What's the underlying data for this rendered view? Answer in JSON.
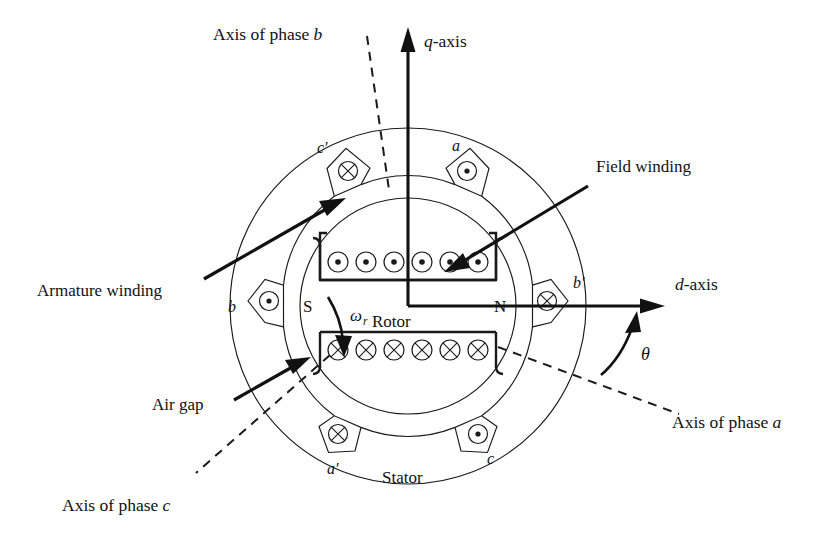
{
  "figure": {
    "background_color": "#ffffff",
    "line_color": "#1a1a1a"
  },
  "axes": [
    {
      "id": "q-axis",
      "name_plain": "q",
      "suffix": "-axis",
      "style": "solid-arrow",
      "label": "q-axis"
    },
    {
      "id": "d-axis",
      "name_plain": "d",
      "suffix": "-axis",
      "style": "solid-arrow",
      "label": "d-axis"
    },
    {
      "id": "axis-of-phase-a",
      "label": "Axis of phase a",
      "lead": "Axis of phase ",
      "italic": "a",
      "style": "dashed"
    },
    {
      "id": "axis-of-phase-b",
      "label": "Axis of phase b",
      "lead": "Axis of phase ",
      "italic": "b",
      "style": "dashed"
    },
    {
      "id": "axis-of-phase-c",
      "label": "Axis of phase c",
      "lead": "Axis of phase ",
      "italic": "c",
      "style": "dashed"
    }
  ],
  "callouts": [
    {
      "id": "field-winding",
      "label": "Field winding",
      "points_to": "rotor-field-conductors"
    },
    {
      "id": "armature-winding",
      "label": "Armature winding",
      "points_to": "stator-slot-c-prime"
    },
    {
      "id": "air-gap",
      "label": "Air gap",
      "points_to": "air-gap-region"
    }
  ],
  "part_labels": [
    {
      "id": "rotor",
      "label": "Rotor"
    },
    {
      "id": "stator",
      "label": "Stator"
    },
    {
      "id": "pole-south",
      "label": "S"
    },
    {
      "id": "pole-north",
      "label": "N"
    }
  ],
  "rotation": {
    "id": "angular-speed",
    "symbol": "ω",
    "subscript": "r",
    "label": "ωr",
    "direction": "clockwise"
  },
  "angle": {
    "id": "rotor-angle",
    "symbol": "θ",
    "label": "θ",
    "between": [
      "axis-of-phase-a",
      "d-axis"
    ]
  },
  "stator_slots": [
    {
      "id": "slot-a",
      "label": "a",
      "current": "out-of-page",
      "symbol": "dot",
      "angle_deg": 60
    },
    {
      "id": "slot-b-prime",
      "label": "b′",
      "current": "into-page",
      "symbol": "cross",
      "angle_deg": 0
    },
    {
      "id": "slot-c",
      "label": "c",
      "current": "out-of-page",
      "symbol": "dot",
      "angle_deg": -60
    },
    {
      "id": "slot-a-prime",
      "label": "a′",
      "current": "into-page",
      "symbol": "cross",
      "angle_deg": -120
    },
    {
      "id": "slot-b",
      "label": "b",
      "current": "out-of-page",
      "symbol": "dot",
      "angle_deg": 180
    },
    {
      "id": "slot-c-prime",
      "label": "c′",
      "current": "into-page",
      "symbol": "cross",
      "angle_deg": 120
    }
  ],
  "rotor_field_winding": {
    "top_slot": {
      "id": "field-slot-top",
      "current": "out-of-page",
      "symbol": "dot",
      "conductor_count": 6
    },
    "bottom_slot": {
      "id": "field-slot-bottom",
      "current": "into-page",
      "symbol": "cross",
      "conductor_count": 6
    }
  },
  "geometry": {
    "center_x": 408,
    "center_y": 306,
    "stator_outer_radius": 178,
    "stator_bore_radius": 126,
    "rotor_radius": 108
  }
}
